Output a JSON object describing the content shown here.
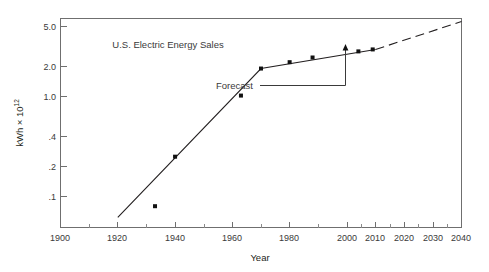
{
  "chart_data": {
    "type": "line",
    "title": "U.S. Electric Energy Sales",
    "xlabel": "Year",
    "ylabel": "kWh × 10",
    "ylabel_exponent": "12",
    "yscale": "log",
    "xlim": [
      1900,
      2040
    ],
    "ylim": [
      0.06,
      6.0
    ],
    "grid": false,
    "legend": false,
    "xticks": [
      1900,
      1920,
      1940,
      1960,
      1980,
      2000,
      2010,
      2020,
      2030,
      2040
    ],
    "xtick_labels": [
      "1900",
      "1920",
      "1940",
      "1960",
      "1980",
      "2000",
      "2010",
      "2020",
      "2030",
      "2040"
    ],
    "xticks_minor": [
      1910,
      1930,
      1950,
      1970,
      1990,
      2005,
      2015,
      2025,
      2035
    ],
    "yticks": [
      0.1,
      0.2,
      0.4,
      1.0,
      2.0,
      5.0
    ],
    "ytick_labels": [
      ".1",
      ".2",
      ".4",
      "1.0",
      "2.0",
      "5.0"
    ],
    "series": [
      {
        "name": "historical-fit-line",
        "style": "solid",
        "x": [
          1920,
          1970,
          2010
        ],
        "y": [
          0.062,
          1.9,
          2.95
        ]
      },
      {
        "name": "forecast-line",
        "style": "dashed",
        "x": [
          2010,
          2040
        ],
        "y": [
          2.95,
          5.6
        ]
      }
    ],
    "points": {
      "name": "observed-sales",
      "x": [
        1933,
        1940,
        1963,
        1970,
        1980,
        1988,
        2004,
        2009
      ],
      "y": [
        0.08,
        0.25,
        1.02,
        1.9,
        2.2,
        2.45,
        2.82,
        2.95
      ]
    },
    "annotations": [
      {
        "name": "forecast-annotation",
        "label": "Forecast",
        "points_to_year": 2015,
        "points_to_value": 3.45
      }
    ]
  },
  "axes": {
    "x_axis_label": "Year",
    "y_axis_label_base": "kWh × 10",
    "y_axis_label_exp": "12"
  },
  "colors": {
    "line": "#231f20",
    "frame": "#6f6f6f",
    "text": "#3a3a3a",
    "background": "#ffffff",
    "point": "#111111"
  }
}
